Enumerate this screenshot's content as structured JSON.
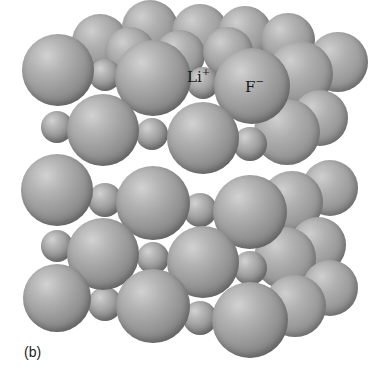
{
  "figure": {
    "caption": "(b)",
    "labels": [
      {
        "ion": "Li",
        "charge": "+",
        "x": 187,
        "y": 68
      },
      {
        "ion": "F",
        "charge": "−",
        "x": 245,
        "y": 78
      }
    ],
    "colors": {
      "sphere_light": "#d2d2d2",
      "sphere_mid": "#969696",
      "sphere_dark": "#6a6a6a",
      "background": "#ffffff"
    },
    "spheres": [
      {
        "layer": "back",
        "x": 100,
        "y": 42,
        "r": 28
      },
      {
        "layer": "back",
        "x": 150,
        "y": 28,
        "r": 28
      },
      {
        "layer": "back",
        "x": 200,
        "y": 32,
        "r": 28
      },
      {
        "layer": "back",
        "x": 245,
        "y": 33,
        "r": 27
      },
      {
        "layer": "back",
        "x": 288,
        "y": 40,
        "r": 27
      },
      {
        "layer": "back",
        "x": 130,
        "y": 52,
        "r": 25
      },
      {
        "layer": "back",
        "x": 180,
        "y": 55,
        "r": 25
      },
      {
        "layer": "back",
        "x": 228,
        "y": 52,
        "r": 25
      },
      {
        "layer": "back",
        "x": 338,
        "y": 62,
        "r": 30
      },
      {
        "layer": "back",
        "x": 300,
        "y": 74,
        "r": 33
      },
      {
        "layer": "back",
        "x": 320,
        "y": 118,
        "r": 28
      },
      {
        "layer": "back",
        "x": 287,
        "y": 132,
        "r": 33
      },
      {
        "layer": "back",
        "x": 330,
        "y": 188,
        "r": 28
      },
      {
        "layer": "back",
        "x": 292,
        "y": 202,
        "r": 31
      },
      {
        "layer": "back",
        "x": 318,
        "y": 245,
        "r": 28
      },
      {
        "layer": "back",
        "x": 285,
        "y": 258,
        "r": 31
      },
      {
        "layer": "back",
        "x": 330,
        "y": 288,
        "r": 28
      },
      {
        "layer": "back",
        "x": 295,
        "y": 306,
        "r": 31
      },
      {
        "layer": "front",
        "ion": "F",
        "x": 58,
        "y": 70,
        "r": 36
      },
      {
        "layer": "front",
        "ion": "Li",
        "x": 105,
        "y": 75,
        "r": 16
      },
      {
        "layer": "front",
        "ion": "F",
        "x": 153,
        "y": 78,
        "r": 38
      },
      {
        "layer": "front",
        "ion": "Li",
        "x": 203,
        "y": 83,
        "r": 16
      },
      {
        "layer": "front",
        "ion": "F",
        "x": 252,
        "y": 86,
        "r": 38
      },
      {
        "layer": "front",
        "ion": "Li",
        "x": 57,
        "y": 127,
        "r": 16
      },
      {
        "layer": "front",
        "ion": "F",
        "x": 103,
        "y": 130,
        "r": 36
      },
      {
        "layer": "front",
        "ion": "Li",
        "x": 152,
        "y": 134,
        "r": 16
      },
      {
        "layer": "front",
        "ion": "F",
        "x": 203,
        "y": 138,
        "r": 36
      },
      {
        "layer": "front",
        "ion": "Li",
        "x": 250,
        "y": 144,
        "r": 17
      },
      {
        "layer": "front",
        "ion": "F",
        "x": 57,
        "y": 190,
        "r": 36
      },
      {
        "layer": "front",
        "ion": "Li",
        "x": 105,
        "y": 200,
        "r": 17
      },
      {
        "layer": "front",
        "ion": "F",
        "x": 153,
        "y": 203,
        "r": 37
      },
      {
        "layer": "front",
        "ion": "Li",
        "x": 200,
        "y": 210,
        "r": 17
      },
      {
        "layer": "front",
        "ion": "F",
        "x": 250,
        "y": 212,
        "r": 37
      },
      {
        "layer": "front",
        "ion": "Li",
        "x": 57,
        "y": 246,
        "r": 16
      },
      {
        "layer": "front",
        "ion": "F",
        "x": 103,
        "y": 254,
        "r": 36
      },
      {
        "layer": "front",
        "ion": "Li",
        "x": 153,
        "y": 258,
        "r": 16
      },
      {
        "layer": "front",
        "ion": "F",
        "x": 203,
        "y": 262,
        "r": 36
      },
      {
        "layer": "front",
        "ion": "Li",
        "x": 250,
        "y": 268,
        "r": 17
      },
      {
        "layer": "front",
        "ion": "F",
        "x": 57,
        "y": 298,
        "r": 34
      },
      {
        "layer": "front",
        "ion": "Li",
        "x": 105,
        "y": 304,
        "r": 17
      },
      {
        "layer": "front",
        "ion": "F",
        "x": 153,
        "y": 306,
        "r": 37
      },
      {
        "layer": "front",
        "ion": "Li",
        "x": 200,
        "y": 318,
        "r": 17
      },
      {
        "layer": "front",
        "ion": "F",
        "x": 250,
        "y": 320,
        "r": 38
      }
    ]
  }
}
